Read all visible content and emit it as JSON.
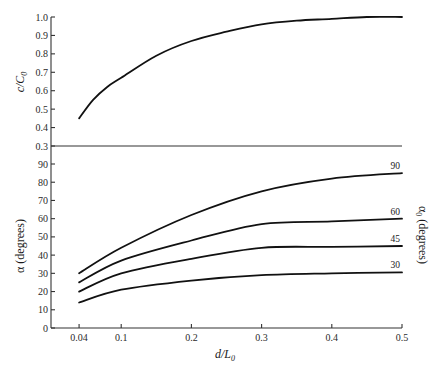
{
  "chart_data": [
    {
      "type": "line",
      "panel": "upper",
      "title": "",
      "xlabel": "d/L0",
      "ylabel": "c/C0",
      "ylim": [
        0.3,
        1.0
      ],
      "xlim": [
        0.0,
        0.5
      ],
      "grid": false,
      "yticks": [
        "1.0",
        "0.9",
        "0.8",
        "0.7",
        "0.6",
        "0.5",
        "0.4",
        "0.3"
      ],
      "series": [
        {
          "name": "c/C0",
          "x": [
            0.04,
            0.06,
            0.08,
            0.1,
            0.15,
            0.2,
            0.25,
            0.3,
            0.35,
            0.4,
            0.45,
            0.5
          ],
          "values": [
            0.45,
            0.55,
            0.62,
            0.67,
            0.79,
            0.87,
            0.92,
            0.96,
            0.98,
            0.99,
            1.0,
            1.0
          ]
        }
      ]
    },
    {
      "type": "line",
      "panel": "lower",
      "title": "",
      "xlabel": "d/L0",
      "ylabel": "α (degrees)",
      "ylabel_right": "α0 (degrees)",
      "ylim": [
        0,
        90
      ],
      "xlim": [
        0.0,
        0.5
      ],
      "grid": false,
      "xticks": [
        "0.04",
        "0.1",
        "0.2",
        "0.3",
        "0.4",
        "0.5"
      ],
      "yticks": [
        "90",
        "80",
        "70",
        "60",
        "50",
        "40",
        "30",
        "20",
        "10",
        "0"
      ],
      "legend_position": "right (inline curve labels)",
      "series": [
        {
          "name": "90",
          "x": [
            0.04,
            0.1,
            0.2,
            0.3,
            0.4,
            0.5
          ],
          "values": [
            30,
            44,
            62,
            75,
            82,
            85
          ]
        },
        {
          "name": "60",
          "x": [
            0.04,
            0.1,
            0.2,
            0.3,
            0.4,
            0.5
          ],
          "values": [
            25,
            37,
            48,
            57,
            58.5,
            60
          ]
        },
        {
          "name": "45",
          "x": [
            0.04,
            0.1,
            0.2,
            0.3,
            0.4,
            0.5
          ],
          "values": [
            20,
            30,
            38,
            44,
            44.5,
            45
          ]
        },
        {
          "name": "30",
          "x": [
            0.04,
            0.1,
            0.2,
            0.3,
            0.4,
            0.5
          ],
          "values": [
            14,
            21,
            26,
            29,
            30,
            30.5
          ]
        }
      ]
    }
  ],
  "labels": {
    "upper_ylabel_main": "c/C",
    "upper_ylabel_sub": "0",
    "lower_ylabel": "α  (degrees)",
    "right_ylabel_main": "α",
    "right_ylabel_sub": "0",
    "right_ylabel_rest": " (degrees)",
    "xlabel_main": "d/L",
    "xlabel_sub": "0"
  },
  "upper_ticks": [
    {
      "label": "1.0",
      "v": 1.0
    },
    {
      "label": "0.9",
      "v": 0.9
    },
    {
      "label": "0.8",
      "v": 0.8
    },
    {
      "label": "0.7",
      "v": 0.7
    },
    {
      "label": "0.6",
      "v": 0.6
    },
    {
      "label": "0.5",
      "v": 0.5
    },
    {
      "label": "0.4",
      "v": 0.4
    },
    {
      "label": "0.3",
      "v": 0.3
    }
  ],
  "lower_ticks": [
    {
      "label": "90",
      "v": 90
    },
    {
      "label": "80",
      "v": 80
    },
    {
      "label": "70",
      "v": 70
    },
    {
      "label": "60",
      "v": 60
    },
    {
      "label": "50",
      "v": 50
    },
    {
      "label": "40",
      "v": 40
    },
    {
      "label": "30",
      "v": 30
    },
    {
      "label": "20",
      "v": 20
    },
    {
      "label": "10",
      "v": 10
    },
    {
      "label": "0",
      "v": 0
    }
  ],
  "x_ticks": [
    {
      "label": "0.04",
      "v": 0.04
    },
    {
      "label": "0.1",
      "v": 0.1
    },
    {
      "label": "0.2",
      "v": 0.2
    },
    {
      "label": "0.3",
      "v": 0.3
    },
    {
      "label": "0.4",
      "v": 0.4
    },
    {
      "label": "0.5",
      "v": 0.5
    }
  ],
  "colors": {
    "curve": "#111111",
    "axis": "#333333",
    "text": "#1a1a1a",
    "background": "#ffffff"
  }
}
